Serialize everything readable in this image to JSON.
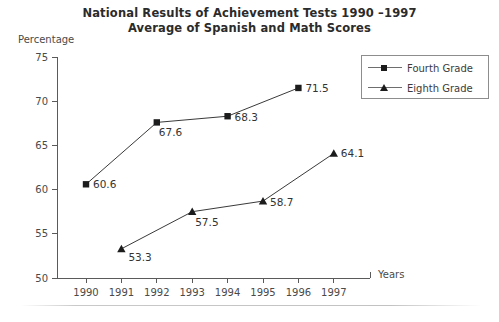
{
  "title": {
    "line1": "National Results of Achievement Tests 1990 –1997",
    "line2": "Average of Spanish and Math Scores"
  },
  "axes": {
    "y_label": "Percentage",
    "x_label": "Years"
  },
  "legend": {
    "items": [
      {
        "label": "Fourth Grade",
        "marker": "square-marker-icon"
      },
      {
        "label": "Eighth Grade",
        "marker": "triangle-marker-icon"
      }
    ]
  },
  "chart_data": {
    "type": "line",
    "xlabel": "Years",
    "ylabel": "Percentage",
    "categories": [
      "1990",
      "1991",
      "1992",
      "1993",
      "1994",
      "1995",
      "1996",
      "1997"
    ],
    "xlim": [
      1990,
      1997
    ],
    "ylim": [
      50,
      75
    ],
    "yticks": [
      50,
      55,
      60,
      65,
      70,
      75
    ],
    "ytick_labels": [
      "50",
      "55",
      "60",
      "65",
      "70",
      "75"
    ],
    "grid": false,
    "legend_position": "top-right",
    "series": [
      {
        "name": "Fourth Grade",
        "marker": "square",
        "x": [
          1990,
          1992,
          1994,
          1996
        ],
        "values": [
          60.6,
          67.6,
          68.3,
          71.5
        ],
        "labels": [
          "60.6",
          "67.6",
          "68.3",
          "71.5"
        ]
      },
      {
        "name": "Eighth Grade",
        "marker": "triangle",
        "x": [
          1991,
          1993,
          1995,
          1997
        ],
        "values": [
          53.3,
          57.5,
          58.7,
          64.1
        ],
        "labels": [
          "53.3",
          "57.5",
          "58.7",
          "64.1"
        ]
      }
    ]
  },
  "colors": {
    "marker": "#1c1c1c",
    "line": "#3a3a3a",
    "axis": "#5a5a5a",
    "text": "#3b3b3b",
    "background": "#ffffff"
  }
}
